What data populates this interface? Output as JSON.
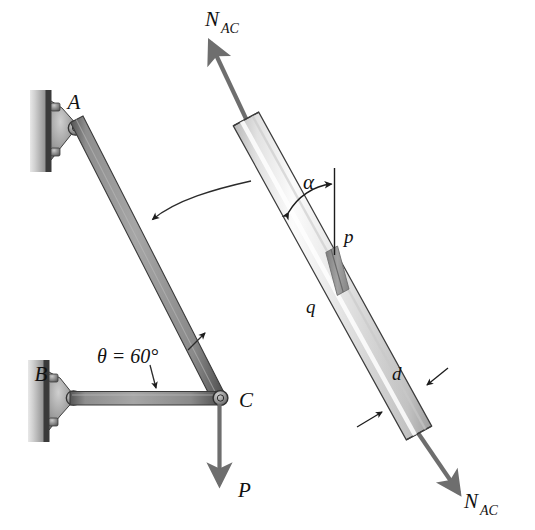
{
  "figure": {
    "background_color": "#ffffff"
  },
  "labels": {
    "joint_a": "A",
    "joint_b": "B",
    "joint_c": "C",
    "load_p": "P",
    "angle_theta": "θ = 60°",
    "angle_alpha": "α",
    "plane_p": "p",
    "plane_q": "q",
    "diameter_d": "d",
    "force_n_main": "N",
    "force_n_sub": "AC",
    "force_n_top": "N",
    "force_n_top_sub": "AC",
    "force_n_bottom": "N",
    "force_n_bottom_sub": "AC"
  },
  "geometry": {
    "member_ac": {
      "from_x": 75,
      "from_y": 128,
      "to_x": 218,
      "to_y": 398,
      "label": "member AC"
    },
    "member_bc": {
      "from_x": 73,
      "from_y": 398,
      "to_x": 218,
      "to_y": 398,
      "label": "member BC"
    },
    "bar_axis": {
      "top_x": 246,
      "top_y": 118,
      "bottom_x": 419,
      "bottom_y": 432,
      "label": "free-body bar AC"
    },
    "load_arrow": {
      "from_x": 219,
      "from_y": 404,
      "to_x": 219,
      "to_y": 487
    },
    "force_top_arrow": {
      "from_x": 250,
      "from_y": 122,
      "to_x": 207,
      "to_y": 30
    },
    "force_bottom_arrow": {
      "from_x": 415,
      "from_y": 428,
      "to_x": 463,
      "to_y": 500
    },
    "leader_curve": {
      "from_x": 249,
      "from_y": 182,
      "to_x": 151,
      "to_y": 220
    }
  },
  "colors": {
    "bar_light": "#f2f2f2",
    "bar_mid": "#d8d8d8",
    "bar_highlight": "#fdfdfd",
    "bar_shadow": "#a8a8a8",
    "bar_outline": "#3c3c3c",
    "member_fill": "#9a9a9a",
    "member_edge": "#4a4a4a",
    "glue_plane": "#9c9c9c",
    "arrow_gray": "#6e6e6e",
    "wall_light": "#d5d5d5",
    "wall_dark": "#8f8f8f",
    "plate_dark": "#3a3a3a",
    "bracket_fill": "#8e8e8e",
    "ink": "#111111",
    "leader_line": "#2b2b2b"
  },
  "description": {
    "wall_a": "vertical wall with bolted bracket at A",
    "wall_b": "vertical wall with bolted bracket at B",
    "glued_joint": "inclined glued plane pq through the circular bar",
    "bar_type": "circular cylindrical bar of diameter d"
  }
}
